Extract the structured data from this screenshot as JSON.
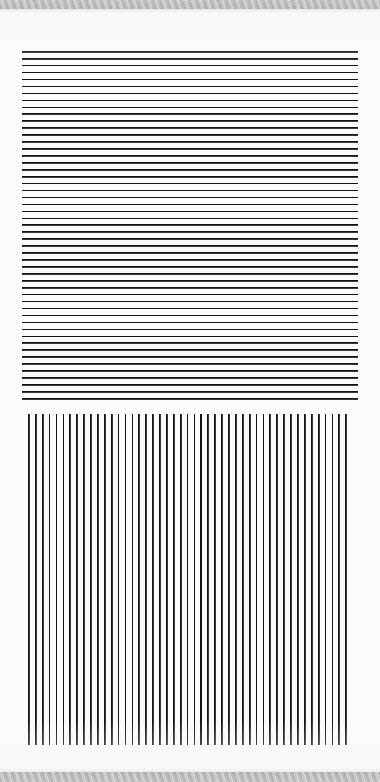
{
  "page": {
    "width": 380,
    "height": 782,
    "background_color": "#fbfbfb",
    "stroke_color": "#141414",
    "stroke_secondary_color": "#3a3a3a",
    "band_color": "#8d8d8d",
    "band_highlight_color": "#bdbdbd"
  },
  "bands": {
    "top": {
      "name": "top-diagonal-hatch-band",
      "y": 0,
      "height": 9,
      "pattern": "diagonal-hatch"
    },
    "bottom": {
      "name": "bottom-diagonal-hatch-band",
      "y": 772,
      "height": 10,
      "pattern": "diagonal-hatch"
    }
  },
  "chart_data": [
    {
      "type": "line",
      "title": "",
      "xlabel": "",
      "ylabel": "",
      "orientation": "horizontal",
      "name": "horizontal-rule-grating",
      "x_start": 22,
      "x_end": 358,
      "y_start": 51,
      "y_end": 405,
      "line_count": 51,
      "line_spacing_px": 6.94,
      "line_thickness_px": 1.6,
      "grid": false,
      "legend": "none",
      "values": [
        51,
        58,
        65,
        72,
        79,
        86,
        93,
        100,
        106,
        113,
        120,
        127,
        134,
        141,
        148,
        155,
        162,
        169,
        176,
        183,
        190,
        197,
        204,
        211,
        217,
        224,
        231,
        238,
        245,
        252,
        259,
        266,
        273,
        280,
        287,
        294,
        301,
        308,
        315,
        322,
        328,
        335,
        342,
        349,
        356,
        363,
        370,
        377,
        384,
        391,
        398
      ]
    },
    {
      "type": "line",
      "title": "",
      "xlabel": "",
      "ylabel": "",
      "orientation": "vertical",
      "name": "vertical-rule-grating",
      "x_start": 28,
      "x_end": 352,
      "y_start": 414,
      "y_end": 745,
      "line_count": 47,
      "line_spacing_px": 6.9,
      "line_thickness_px": 1.7,
      "grid": false,
      "legend": "none",
      "values": [
        28,
        35,
        42,
        49,
        56,
        63,
        70,
        77,
        83,
        90,
        97,
        104,
        111,
        118,
        125,
        132,
        139,
        146,
        153,
        160,
        166,
        173,
        180,
        187,
        194,
        201,
        208,
        215,
        222,
        229,
        236,
        242,
        249,
        256,
        263,
        270,
        277,
        284,
        291,
        298,
        305,
        312,
        318,
        325,
        332,
        339,
        346
      ]
    }
  ]
}
